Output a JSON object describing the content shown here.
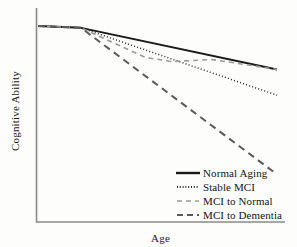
{
  "chart_data": {
    "type": "line",
    "title": "",
    "xlabel": "Age",
    "ylabel": "Cognitive Ability",
    "xlim": [
      0,
      100
    ],
    "ylim": [
      0,
      100
    ],
    "grid": false,
    "axis_ticks": false,
    "legend_position": "bottom-right",
    "axis_color": "#8a8a8a",
    "background_color": "#fdfdfc",
    "divergence_point": {
      "x": 18,
      "y": 93
    },
    "series": [
      {
        "name": "Normal Aging",
        "style": "solid",
        "color": "#1a1a1a",
        "width": 2.0,
        "x": [
          0,
          18,
          100
        ],
        "y": [
          94,
          93,
          72
        ]
      },
      {
        "name": "Stable MCI",
        "style": "dotted",
        "color": "#2b2b2b",
        "width": 1.5,
        "x": [
          0,
          18,
          100
        ],
        "y": [
          94,
          93,
          59
        ]
      },
      {
        "name": "MCI to Normal",
        "style": "dashed-short",
        "color": "#9a9a9a",
        "width": 1.6,
        "x": [
          0,
          18,
          45,
          56,
          73,
          100
        ],
        "y": [
          94,
          93,
          78,
          76,
          77,
          72
        ]
      },
      {
        "name": "MCI to Dementia",
        "style": "dashed-long",
        "color": "#5a5a5a",
        "width": 2.0,
        "x": [
          0,
          18,
          100
        ],
        "y": [
          94,
          93,
          19
        ]
      }
    ]
  },
  "legend": {
    "items": [
      {
        "label": "Normal Aging",
        "sample": "solid-line-sample"
      },
      {
        "label": "Stable MCI",
        "sample": "dotted-line-sample"
      },
      {
        "label": "MCI to Normal",
        "sample": "short-dashed-line-sample"
      },
      {
        "label": "MCI to Dementia",
        "sample": "long-dashed-line-sample"
      }
    ]
  },
  "axes": {
    "x_title": "Age",
    "y_title": "Cognitive Ability"
  }
}
